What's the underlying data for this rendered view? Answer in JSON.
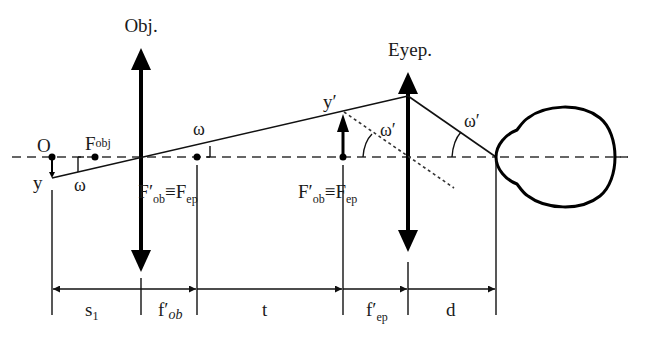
{
  "diagram": {
    "lenses": {
      "objective": {
        "label": "Obj."
      },
      "eyepiece": {
        "label": "Eyep."
      }
    },
    "points": {
      "object_point": "O",
      "object_height": "y",
      "objective_focus": "F",
      "objective_focus_sub": "obj",
      "image_height": "y′"
    },
    "focal_labels": [
      {
        "main": "F′",
        "sub1": "ob",
        "eq": "≡",
        "main2": "F",
        "sub2": "ep"
      },
      {
        "main": "F′",
        "sub1": "ob",
        "eq": "≡",
        "main2": "F",
        "sub2": "ep"
      }
    ],
    "angles": {
      "omega": "ω",
      "omega_prime": "ω′"
    },
    "dimensions": {
      "s1": {
        "main": "s",
        "sub": "1"
      },
      "f_ob": {
        "main": "f′",
        "sub": "ob"
      },
      "t": {
        "main": "t"
      },
      "f_ep": {
        "main": "f′",
        "sub": "ep"
      },
      "d": {
        "main": "d"
      }
    },
    "colors": {
      "line": "#111111",
      "axis": "#333333"
    }
  }
}
